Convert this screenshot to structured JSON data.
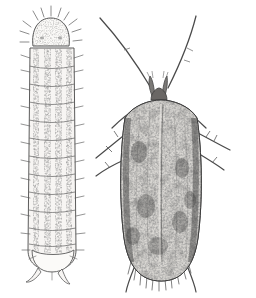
{
  "figure": {
    "medium": "pen-and-ink stipple line drawing",
    "background_color": "#ffffff",
    "ink_color": "#3a3a3a",
    "view": "dorsal",
    "canvas": {
      "width": 256,
      "height": 298
    },
    "caption": ""
  },
  "subjects": [
    {
      "id": "larva",
      "name": "caterpillar-larva",
      "label": "",
      "orientation": "vertical, head at top",
      "bounds": {
        "x": 22,
        "y": 12,
        "width": 58,
        "height": 272
      },
      "body": {
        "fill_color": "#f2f0ee",
        "outline_color": "#4a4a4a",
        "segment_count": 12,
        "stripe_count": 4,
        "stripe_color": "#2e2e2e",
        "stripe_style": "longitudinal broken dotted bands",
        "seta_color": "#5a5a5a",
        "setae_per_segment": 4
      },
      "head": {
        "name": "head-capsule",
        "fill_color": "#fbfaf8",
        "outline_color": "#555555",
        "shape": "rounded rectangular capsule",
        "seta_count": 11
      },
      "tail": {
        "name": "anal-plate",
        "fill_color": "#fbfaf8",
        "proleg_count": 2
      }
    },
    {
      "id": "adult",
      "name": "adult-moth",
      "label": "",
      "orientation": "vertical, head at top, wings folded",
      "bounds": {
        "x": 96,
        "y": 14,
        "width": 140,
        "height": 278
      },
      "wings": {
        "name": "forewing-pair",
        "base_color": "#8f8d8a",
        "speckle_color": "#2b2b2b",
        "highlight_color": "#d8d6d2",
        "outline_color": "#3c3c3c",
        "shape": "elongate oval, rounded apex",
        "fringe": true,
        "fringe_color": "#4a4a4a",
        "span_left": 122,
        "span_right": 200
      },
      "thorax": {
        "name": "thorax",
        "fill_color": "#545250",
        "shape": "trapezoid"
      },
      "head": {
        "name": "head",
        "fill_color": "#6a6765",
        "palp_count": 2,
        "palp_label": "labial palps, upturned"
      },
      "antennae": {
        "name": "antenna-pair",
        "count": 2,
        "color": "#4a4a4a",
        "style": "long, filiform, swept upward and outward"
      },
      "legs": {
        "name": "leg-set",
        "count": 6,
        "color": "#4a4a4a",
        "spurs": true
      }
    }
  ]
}
